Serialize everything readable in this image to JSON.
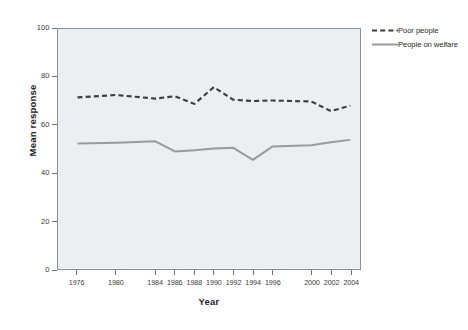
{
  "chart_data": {
    "type": "line",
    "title": "",
    "xlabel": "Year",
    "ylabel": "Mean response",
    "xlim": [
      1974,
      2005
    ],
    "ylim": [
      0,
      100
    ],
    "yticks": [
      0,
      20,
      40,
      60,
      80,
      100
    ],
    "xticks": [
      1976,
      1980,
      1984,
      1986,
      1988,
      1990,
      1992,
      1994,
      1996,
      2000,
      2002,
      2004
    ],
    "xtick_labels": [
      "1976",
      "1980",
      "1984",
      "1986",
      "1988",
      "1990",
      "1992",
      "1994",
      "1996",
      "2000",
      "2002",
      "2004"
    ],
    "ytick_labels": [
      "0",
      "20",
      "40",
      "60",
      "80",
      "100"
    ],
    "grid": false,
    "legend_position": "right",
    "plot_background": "#eceff1",
    "x": [
      1976,
      1980,
      1984,
      1986,
      1988,
      1990,
      1992,
      1994,
      1996,
      2000,
      2002,
      2004
    ],
    "series": [
      {
        "name": "Poor people",
        "style": "dashed",
        "color": "#3d3d3d",
        "values": [
          71.5,
          72.5,
          71.0,
          72.0,
          68.8,
          75.8,
          70.5,
          70.0,
          70.2,
          69.8,
          65.8,
          68.0
        ]
      },
      {
        "name": "People on welfare",
        "style": "solid",
        "color": "#9a9a9a",
        "values": [
          52.3,
          52.6,
          53.2,
          49.0,
          49.5,
          50.2,
          50.5,
          45.5,
          51.0,
          51.6,
          52.8,
          53.8
        ]
      }
    ]
  },
  "legend": {
    "items": [
      {
        "label": "Poor people",
        "style": "dashed",
        "color": "#3d3d3d"
      },
      {
        "label": "People on welfare",
        "style": "solid",
        "color": "#9a9a9a"
      }
    ]
  }
}
